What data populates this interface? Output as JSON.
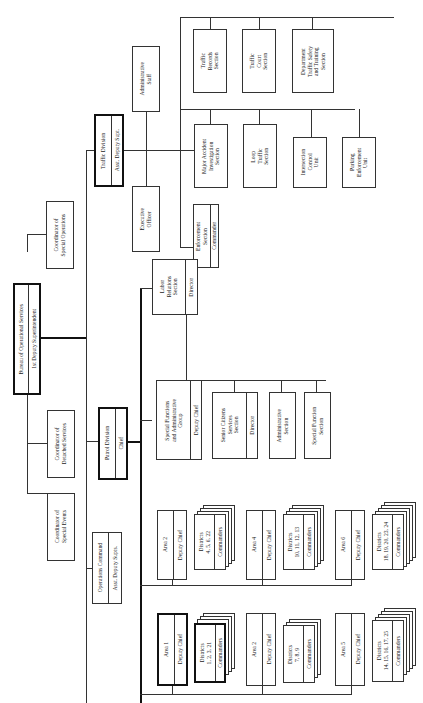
{
  "root": {
    "title": "Bureau of Operational Services",
    "subtitle": "1st Deputy Superintendent"
  },
  "coordinators": {
    "special_operations": "Coordinator of\nSpecial Operations",
    "detached_services": "Coordinator of\nDetached Services",
    "special_events": "Coordinator of\nSpecial Events"
  },
  "traffic": {
    "title": "Traffic Division",
    "subtitle": "Asst. Deputy Supt.",
    "administrative_staff": "Administrative\nStaff",
    "executive_officer": "Executive\nOfficer",
    "enforcement": {
      "title": "Enforcement\nSection",
      "subtitle": "Commander"
    },
    "major_accident": "Major Accident\nInvestigation\nSection",
    "loop_traffic": "Loop\nTraffic\nSection",
    "intersection_control": "Intersection\nControl\nUnit",
    "parking_enforcement": "Parking\nEnforcement\nUnit",
    "traffic_records": "Traffic\nRecords\nSection",
    "traffic_court": "Traffic\nCourt\nSection",
    "safety_training": "Department\nTraffic Safety\nand Training\nSection"
  },
  "patrol": {
    "title": "Patrol Division",
    "subtitle": "Chief",
    "labor_relations": {
      "title": "Labor\nRelations\nSection",
      "subtitle": "Director"
    },
    "special_functions": {
      "title": "Special Functions\nand Administrative\nGroup",
      "subtitle": "Deputy Chief"
    },
    "senior_citizens": {
      "title": "Senior Citizens\nServices\nSection",
      "subtitle": "Director"
    },
    "administrative_section": "Administrative\nSection",
    "special_function_section": "Special Function\nSection"
  },
  "operations": {
    "title": "Operations Command",
    "subtitle": "Asst. Deputy Supts."
  },
  "areas": [
    {
      "name": "Area 1",
      "head": "Deputy Chief",
      "districts": "Districts\n1, 2, 3, 21",
      "commanders": "Commanders"
    },
    {
      "name": "Area 2",
      "head": "Deputy Chief",
      "districts": "Districts\n7, 8, 9",
      "commanders": "Commanders"
    },
    {
      "name": "Area 5",
      "head": "Deputy Chief",
      "districts": "Districts\n14, 15, 16, 17, 25",
      "commanders": "Commanders"
    },
    {
      "name": "Area 2",
      "head": "Deputy Chief",
      "districts": "Districts\n4, 5, 6, 22",
      "commanders": "Commanders"
    },
    {
      "name": "Area 4",
      "head": "Deputy Chief",
      "districts": "Districts\n10, 11, 12, 13",
      "commanders": "Commanders"
    },
    {
      "name": "Area 6",
      "head": "Deputy Chief",
      "districts": "Districts\n18, 19, 20, 23, 24",
      "commanders": "Commanders"
    }
  ]
}
